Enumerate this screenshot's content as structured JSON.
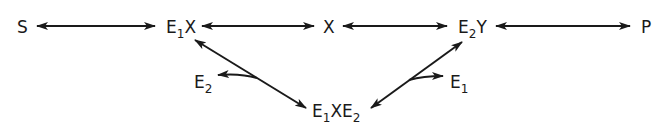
{
  "diagram": {
    "type": "reaction-scheme",
    "nodes": {
      "S": {
        "base": "S",
        "sub": ""
      },
      "E1X": {
        "base": "E",
        "sub": "1",
        "suffix": "X"
      },
      "X": {
        "base": "X",
        "sub": ""
      },
      "E2Y": {
        "base": "E",
        "sub": "2",
        "suffix": "Y"
      },
      "P": {
        "base": "P",
        "sub": ""
      },
      "E1XE2": {
        "base": "E",
        "sub": "1",
        "mid": "XE",
        "sub2": "2"
      },
      "E2_released": {
        "base": "E",
        "sub": "2"
      },
      "E1_released": {
        "base": "E",
        "sub": "1"
      }
    },
    "edges": [
      {
        "from": "S",
        "to": "E1X",
        "type": "reversible"
      },
      {
        "from": "E1X",
        "to": "X",
        "type": "reversible"
      },
      {
        "from": "X",
        "to": "E2Y",
        "type": "reversible"
      },
      {
        "from": "E2Y",
        "to": "P",
        "type": "reversible"
      },
      {
        "from": "E1X",
        "to": "E1XE2",
        "type": "reversible",
        "side_branch": "E2"
      },
      {
        "from": "E1XE2",
        "to": "E2Y",
        "type": "reversible",
        "side_branch": "E1"
      }
    ],
    "color": "#1a1a1a"
  }
}
